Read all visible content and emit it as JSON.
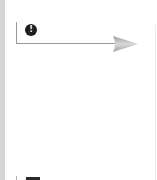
{
  "diagram": {
    "badge": {
      "icon": "exclamation-circle-icon",
      "glyph": "!"
    },
    "arrow": {
      "direction": "right",
      "color": "#9a9a9a",
      "head_color": "#b8b8b8"
    },
    "colors": {
      "strip": "#d6d6d6",
      "badge_bg": "#1e1e1e",
      "line": "#9a9a9a"
    }
  }
}
